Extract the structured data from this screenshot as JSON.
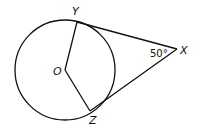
{
  "diagram": {
    "type": "geometry",
    "circle": {
      "center_label": "O",
      "cx": 65,
      "cy": 70,
      "r": 50
    },
    "points": {
      "O": {
        "label": "O",
        "x": 65,
        "y": 70
      },
      "Y": {
        "label": "Y",
        "x": 77,
        "y": 22
      },
      "Z": {
        "label": "Z",
        "x": 90,
        "y": 111
      },
      "X": {
        "label": "X",
        "x": 177,
        "y": 49
      }
    },
    "segments": [
      {
        "from": "O",
        "to": "Y"
      },
      {
        "from": "O",
        "to": "Z"
      },
      {
        "from": "Y",
        "to": "X"
      },
      {
        "from": "Z",
        "to": "X"
      }
    ],
    "angle": {
      "vertex": "X",
      "label": "50°"
    },
    "colors": {
      "stroke": "#111111",
      "background": "#ffffff"
    }
  }
}
